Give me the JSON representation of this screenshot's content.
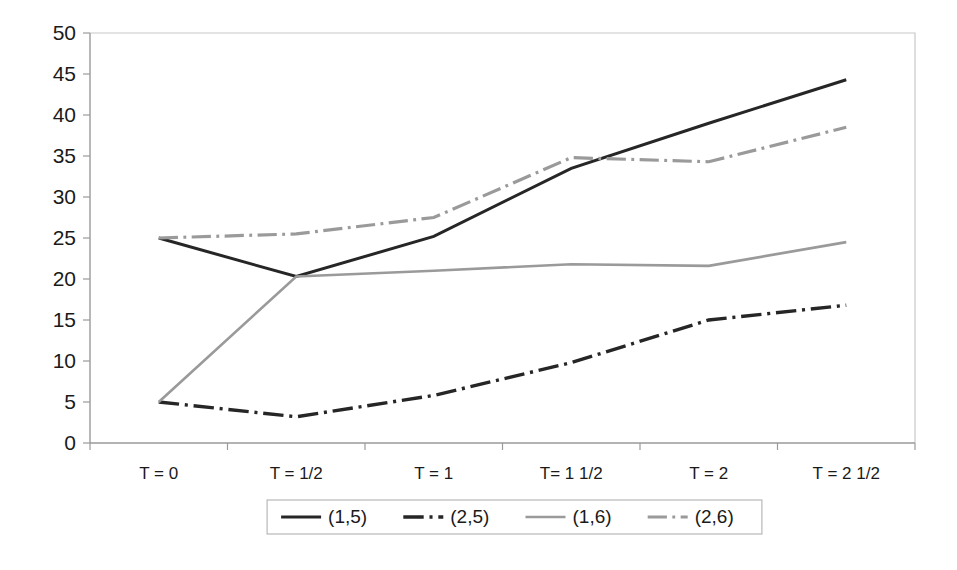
{
  "chart_data": {
    "type": "line",
    "title": "",
    "subtitle": "",
    "xlabel": "",
    "ylabel": "",
    "categories": [
      "T = 0",
      "T = 1/2",
      "T = 1",
      "T= 1 1/2",
      "T = 2",
      "T = 2 1/2"
    ],
    "ylim": [
      0,
      50
    ],
    "yticks": [
      0,
      5,
      10,
      15,
      20,
      25,
      30,
      35,
      40,
      45,
      50
    ],
    "ytick_labels": [
      "0",
      "5",
      "10",
      "15",
      "20",
      "25",
      "30",
      "35",
      "40",
      "45",
      "50"
    ],
    "grid": false,
    "legend_position": "bottom",
    "series": [
      {
        "name": "(1,5)",
        "values": [
          25.0,
          20.3,
          25.2,
          33.5,
          39.0,
          44.3
        ],
        "color": "#262626",
        "style": "solid",
        "width": 3.0
      },
      {
        "name": "(2,5)",
        "values": [
          5.0,
          3.2,
          5.8,
          9.8,
          15.0,
          16.8
        ],
        "color": "#262626",
        "style": "dash-dot",
        "width": 3.4
      },
      {
        "name": "(1,6)",
        "values": [
          5.0,
          20.3,
          21.0,
          21.8,
          21.6,
          24.5
        ],
        "color": "#9a9a9a",
        "style": "solid",
        "width": 2.6
      },
      {
        "name": "(2,6)",
        "values": [
          25.0,
          25.5,
          27.5,
          34.8,
          34.3,
          38.5
        ],
        "color": "#9a9a9a",
        "style": "dash-dot",
        "width": 3.2
      }
    ]
  },
  "axes": {
    "y_axis_name": "value-axis",
    "x_axis_name": "time-category-axis"
  },
  "legend": {
    "entries": [
      "(1,5)",
      "(2,5)",
      "(1,6)",
      "(2,6)"
    ]
  }
}
